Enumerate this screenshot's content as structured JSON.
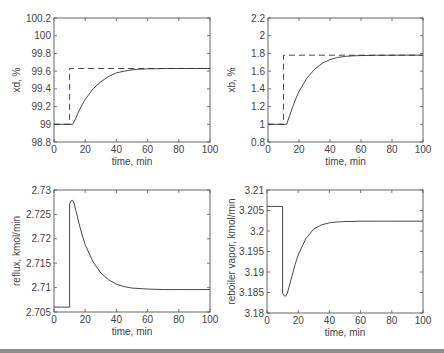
{
  "chart_data": [
    {
      "type": "line",
      "id": "xd",
      "title": "",
      "xlabel": "time, min",
      "ylabel": "xd, %",
      "xlim": [
        0,
        100
      ],
      "ylim": [
        98.8,
        100.2
      ],
      "xticks": [
        0,
        20,
        40,
        60,
        80,
        100
      ],
      "yticks": [
        98.8,
        99,
        99.2,
        99.4,
        99.6,
        99.8,
        100,
        100.2
      ],
      "ytick_labels": [
        "98.8",
        "99",
        "99.2",
        "99.4",
        "99.6",
        "99.8",
        "100",
        "100.2"
      ],
      "grid": false,
      "series": [
        {
          "name": "setpoint",
          "style": "dashed",
          "x": [
            0,
            10,
            10,
            100
          ],
          "y": [
            99.0,
            99.0,
            99.63,
            99.63
          ]
        },
        {
          "name": "response",
          "style": "solid",
          "x": [
            0,
            12,
            14,
            16,
            18,
            20,
            25,
            30,
            35,
            40,
            45,
            50,
            55,
            60,
            70,
            80,
            100
          ],
          "y": [
            99.0,
            99.0,
            99.07,
            99.15,
            99.22,
            99.28,
            99.4,
            99.48,
            99.54,
            99.58,
            99.6,
            99.615,
            99.622,
            99.626,
            99.629,
            99.63,
            99.63
          ]
        }
      ]
    },
    {
      "type": "line",
      "id": "xb",
      "title": "",
      "xlabel": "time, min",
      "ylabel": "xb, %",
      "xlim": [
        0,
        100
      ],
      "ylim": [
        0.8,
        2.2
      ],
      "xticks": [
        0,
        20,
        40,
        60,
        80,
        100
      ],
      "yticks": [
        0.8,
        1,
        1.2,
        1.4,
        1.6,
        1.8,
        2,
        2.2
      ],
      "ytick_labels": [
        "0.8",
        "1",
        "1.2",
        "1.4",
        "1.6",
        "1.8",
        "2",
        "2.2"
      ],
      "grid": false,
      "series": [
        {
          "name": "setpoint",
          "style": "dashed",
          "x": [
            0,
            10,
            10,
            100
          ],
          "y": [
            1.0,
            1.0,
            1.78,
            1.78
          ]
        },
        {
          "name": "response",
          "style": "solid",
          "x": [
            0,
            12,
            14,
            16,
            18,
            20,
            25,
            30,
            35,
            40,
            45,
            50,
            55,
            60,
            70,
            80,
            100
          ],
          "y": [
            1.0,
            1.0,
            1.1,
            1.2,
            1.29,
            1.37,
            1.52,
            1.62,
            1.69,
            1.73,
            1.755,
            1.767,
            1.773,
            1.776,
            1.779,
            1.78,
            1.78
          ]
        }
      ]
    },
    {
      "type": "line",
      "id": "reflux",
      "title": "",
      "xlabel": "time, min",
      "ylabel": "reflux, kmol/min",
      "xlim": [
        0,
        100
      ],
      "ylim": [
        2.705,
        2.73
      ],
      "xticks": [
        0,
        20,
        40,
        60,
        80,
        100
      ],
      "yticks": [
        2.705,
        2.71,
        2.715,
        2.72,
        2.725,
        2.73
      ],
      "ytick_labels": [
        "2.705",
        "2.71",
        "2.715",
        "2.72",
        "2.725",
        "2.73"
      ],
      "grid": false,
      "series": [
        {
          "name": "reflux",
          "style": "solid",
          "x": [
            0,
            10,
            10,
            11,
            12,
            13,
            14,
            16,
            18,
            20,
            25,
            30,
            35,
            40,
            45,
            50,
            60,
            70,
            80,
            100
          ],
          "y": [
            2.706,
            2.706,
            2.7272,
            2.7278,
            2.7279,
            2.7272,
            2.7258,
            2.7232,
            2.7208,
            2.7188,
            2.7153,
            2.713,
            2.7116,
            2.7107,
            2.7102,
            2.7099,
            2.7097,
            2.7096,
            2.7096,
            2.7096
          ]
        }
      ]
    },
    {
      "type": "line",
      "id": "reboiler",
      "title": "",
      "xlabel": "time, min",
      "ylabel": "reboiler vapor, kmol/min",
      "xlim": [
        0,
        100
      ],
      "ylim": [
        3.18,
        3.21
      ],
      "xticks": [
        0,
        20,
        40,
        60,
        80,
        100
      ],
      "yticks": [
        3.18,
        3.185,
        3.19,
        3.195,
        3.2,
        3.205,
        3.21
      ],
      "ytick_labels": [
        "3.18",
        "3.185",
        "3.19",
        "3.195",
        "3.2",
        "3.205",
        "3.21"
      ],
      "grid": false,
      "series": [
        {
          "name": "reboiler vapor",
          "style": "solid",
          "x": [
            0,
            10,
            10,
            11,
            12,
            13,
            14,
            16,
            18,
            20,
            25,
            30,
            35,
            40,
            45,
            50,
            60,
            70,
            80,
            100
          ],
          "y": [
            3.206,
            3.206,
            3.1848,
            3.1842,
            3.1841,
            3.1848,
            3.1862,
            3.189,
            3.1918,
            3.1942,
            3.1982,
            3.2005,
            3.2015,
            3.202,
            3.2022,
            3.2023,
            3.2024,
            3.2024,
            3.2024,
            3.2024
          ]
        }
      ]
    }
  ],
  "layout": {
    "panels": [
      {
        "left": 54,
        "top": 18,
        "right": 210,
        "bottom": 142
      },
      {
        "left": 268,
        "top": 18,
        "right": 423,
        "bottom": 142
      },
      {
        "left": 54,
        "top": 190,
        "right": 210,
        "bottom": 312
      },
      {
        "left": 267,
        "top": 190,
        "right": 423,
        "bottom": 313
      }
    ]
  }
}
